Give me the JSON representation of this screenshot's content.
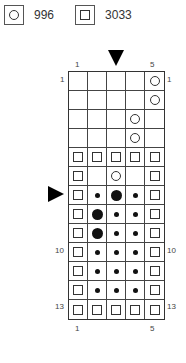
{
  "legend": [
    {
      "symbol": "circle",
      "label": "996"
    },
    {
      "symbol": "square",
      "label": "3033"
    }
  ],
  "chart": {
    "columns": 5,
    "rows": 13,
    "column_labels_top": [
      {
        "col": 1,
        "text": "1"
      },
      {
        "col": 5,
        "text": "5"
      }
    ],
    "column_labels_bottom": [
      {
        "col": 1,
        "text": "1"
      },
      {
        "col": 5,
        "text": "5"
      }
    ],
    "row_labels_left": [
      {
        "row": 1,
        "text": "1"
      },
      {
        "row": 10,
        "text": "10"
      },
      {
        "row": 13,
        "text": "13"
      }
    ],
    "row_labels_right": [
      {
        "row": 1,
        "text": "1"
      },
      {
        "row": 10,
        "text": "10"
      },
      {
        "row": 13,
        "text": "13"
      }
    ],
    "center_column_marker": 3,
    "center_row_marker": 7,
    "cells": [
      [
        "",
        "",
        "",
        "",
        "circle"
      ],
      [
        "",
        "",
        "",
        "",
        "circle"
      ],
      [
        "",
        "",
        "",
        "circle",
        ""
      ],
      [
        "",
        "",
        "",
        "circle",
        ""
      ],
      [
        "square",
        "square",
        "square",
        "square",
        "square"
      ],
      [
        "square",
        "",
        "circle",
        "",
        "square"
      ],
      [
        "square",
        "dot",
        "bigdot",
        "dot",
        "square"
      ],
      [
        "square",
        "bigdot",
        "dot",
        "dot",
        "square"
      ],
      [
        "square",
        "bigdot",
        "dot",
        "dot",
        "square"
      ],
      [
        "square",
        "dot",
        "dot",
        "dot",
        "square"
      ],
      [
        "square",
        "dot",
        "dot",
        "dot",
        "square"
      ],
      [
        "square",
        "dot",
        "dot",
        "dot",
        "square"
      ],
      [
        "square",
        "square",
        "square",
        "square",
        "square"
      ]
    ]
  }
}
